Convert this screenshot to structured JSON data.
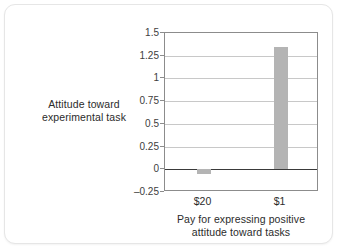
{
  "chart_data": {
    "type": "bar",
    "title": "",
    "categories": [
      "$20",
      "$1"
    ],
    "values": [
      -0.05,
      1.35
    ],
    "series": [
      {
        "name": "Attitude toward experimental task",
        "values": [
          -0.05,
          1.35
        ]
      }
    ],
    "xlabel": "Pay for expressing positive attitude toward tasks",
    "ylabel": "Attitude toward experimental task",
    "ylim": [
      -0.25,
      1.5
    ],
    "ytick_values": [
      1.5,
      1.25,
      1,
      0.75,
      0.5,
      0.25,
      0,
      -0.25
    ],
    "ytick_labels": [
      "1.5",
      "1.25",
      "1",
      "0.75",
      "0.5",
      "0.25",
      "0",
      "–0.25"
    ],
    "grid": true,
    "legend": "none",
    "bar_color": "#b4b4b4",
    "zero_line_color": "#3a3a3a",
    "grid_color": "#c8c8c8",
    "axis_color": "#8c8c8c"
  },
  "axes": {
    "y_title_line1": "Attitude toward",
    "y_title_line2": "experimental task",
    "x_title_line1": "Pay for expressing positive",
    "x_title_line2": "attitude toward tasks"
  },
  "yticks": [
    {
      "label": "1.5",
      "value": 1.5
    },
    {
      "label": "1.25",
      "value": 1.25
    },
    {
      "label": "1",
      "value": 1
    },
    {
      "label": "0.75",
      "value": 0.75
    },
    {
      "label": "0.5",
      "value": 0.5
    },
    {
      "label": "0.25",
      "value": 0.25
    },
    {
      "label": "0",
      "value": 0
    },
    {
      "label": "–0.25",
      "value": -0.25
    }
  ],
  "bars": [
    {
      "label": "$20",
      "value": -0.05
    },
    {
      "label": "$1",
      "value": 1.35
    }
  ]
}
